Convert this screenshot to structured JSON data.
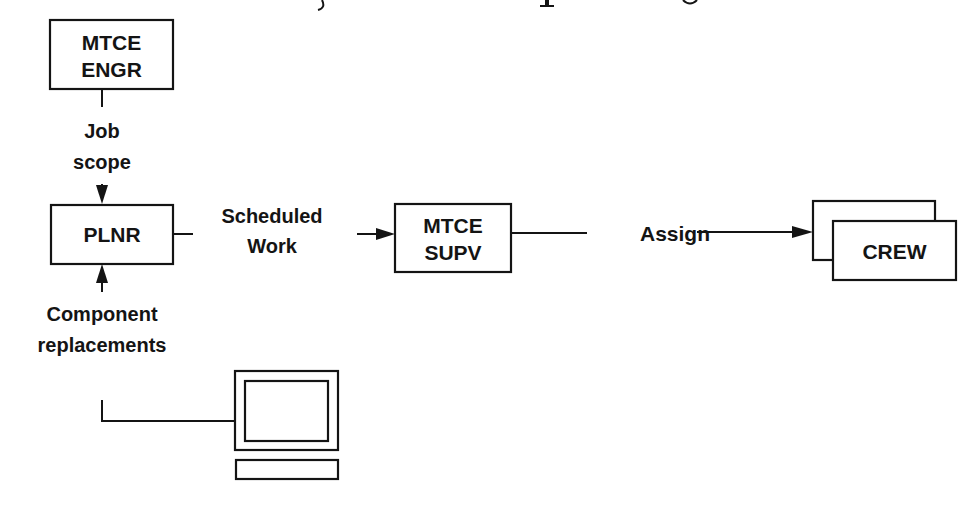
{
  "diagram": {
    "nodes": {
      "mtce_engr": {
        "line1": "MTCE",
        "line2": "ENGR"
      },
      "plnr": {
        "label": "PLNR"
      },
      "mtce_supv": {
        "line1": "MTCE",
        "line2": "SUPV"
      },
      "crew": {
        "label": "CREW"
      }
    },
    "edges": {
      "job_scope": {
        "line1": "Job",
        "line2": "scope"
      },
      "scheduled_work": {
        "line1": "Scheduled",
        "line2": "Work"
      },
      "assign": {
        "label": "Assign"
      },
      "component_replacements": {
        "line1": "Component",
        "line2": "replacements"
      }
    },
    "icons": {
      "computer": "computer-terminal-icon"
    },
    "colors": {
      "ink": "#141414",
      "background": "#ffffff"
    }
  }
}
